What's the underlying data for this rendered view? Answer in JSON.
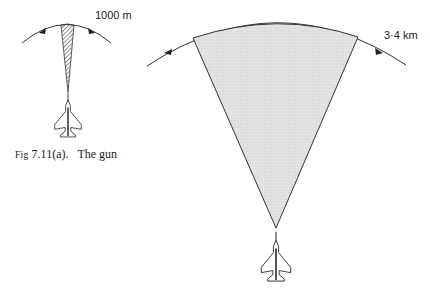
{
  "figure": {
    "caption_prefix": "Fig",
    "caption_number": "7.11(a).",
    "caption_text": "The gun"
  },
  "gun": {
    "range_label": "1000 m",
    "sector_style": "hatched"
  },
  "missile": {
    "range_label": "3·4 km",
    "sector_style": "stippled-grey"
  },
  "colors": {
    "line": "#333333",
    "fill": "#dcdcdc"
  }
}
